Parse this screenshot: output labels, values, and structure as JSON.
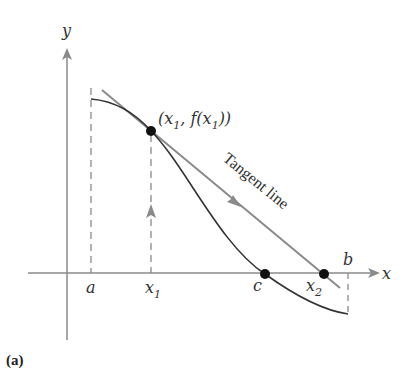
{
  "figure": {
    "panel_label": "(a)",
    "axes": {
      "x_label": "x",
      "y_label": "y"
    },
    "x_markers": [
      {
        "id": "a",
        "label": "a",
        "sub": ""
      },
      {
        "id": "x1",
        "label": "x",
        "sub": "1"
      },
      {
        "id": "c",
        "label": "c",
        "sub": ""
      },
      {
        "id": "x2",
        "label": "x",
        "sub": "2"
      },
      {
        "id": "b",
        "label": "b",
        "sub": ""
      }
    ],
    "point_label": {
      "open": "(x",
      "sub1": "1",
      "mid": ", f(x",
      "sub2": "1",
      "close": "))"
    },
    "tangent_label": "Tangent line",
    "colors": {
      "curve": "#333333",
      "tangent": "#8a8a8a",
      "axis": "#8a8a8a",
      "point": "#111111"
    }
  }
}
